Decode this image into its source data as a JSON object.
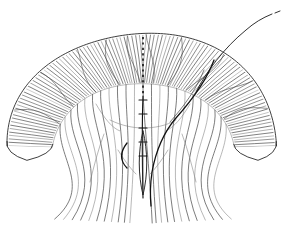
{
  "figure": {
    "domain": "Natural-Image",
    "title": "Line-art illustration of a bilaterally symmetric arched lobed organ",
    "medium": "ink line drawing",
    "background_color": "#ffffff",
    "ink_color": "#1c1c1c",
    "hatch_color": "#2b2b2b",
    "vein_color": "#4a4a4a",
    "faint_vein_color": "#7d7d7d",
    "canvas": {
      "width": 286,
      "height": 231
    }
  },
  "parts": [
    {
      "id": "outer-band-left",
      "label": "left hatched arch band"
    },
    {
      "id": "outer-band-right",
      "label": "right hatched arch band"
    },
    {
      "id": "inner-fan",
      "label": "inner fan of veins"
    },
    {
      "id": "midline",
      "label": "dorsal beaded midline"
    },
    {
      "id": "central-spindle",
      "label": "central spindle"
    },
    {
      "id": "dark-sweep",
      "label": "dark sweeping curve"
    },
    {
      "id": "filament",
      "label": "upper-right filament"
    },
    {
      "id": "left-tip",
      "label": "left tapering tip"
    },
    {
      "id": "right-tip",
      "label": "right tapering tip"
    }
  ],
  "geometry": {
    "arch_center": {
      "x": 143,
      "y": 150
    },
    "arch_outer_radius": 120,
    "arch_inner_radius": 82,
    "arch_start_angle_deg": 182,
    "arch_end_angle_deg": 358,
    "hatch_count": 104,
    "inner_vein_count": 22,
    "midline_x": 143,
    "midline_top_y": 37,
    "midline_bottom_y": 198,
    "spindle": {
      "cx": 143,
      "cy": 163,
      "half_width": 5,
      "half_height": 32
    },
    "filament_end": {
      "x": 272,
      "y": 14
    }
  }
}
